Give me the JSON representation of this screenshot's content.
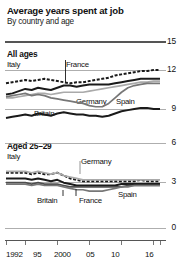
{
  "header": {
    "title": "Average years spent at job",
    "subtitle": "By country and age"
  },
  "panels": {
    "top": {
      "title": "All ages",
      "gridline_labels": [
        "15",
        "12",
        "9"
      ],
      "series_labels": [
        "Italy",
        "France",
        "Germany",
        "Spain",
        "Britain"
      ]
    },
    "bottom": {
      "title": "Aged 25–29",
      "gridline_labels": [
        "6",
        "3",
        "0"
      ],
      "series_labels": [
        "Italy",
        "Germany",
        "Britain",
        "France",
        "Spain"
      ]
    }
  },
  "xaxis": {
    "tick_labels": [
      "1992",
      "95",
      "2000",
      "05",
      "10",
      "16"
    ]
  },
  "colors": {
    "black": "#1a1a1a",
    "dark_gray": "#4d4d4d",
    "mid_gray": "#777777",
    "light_gray": "#aaaaaa",
    "gridline": "#9a9a9a",
    "rule": "#555555",
    "background": "#ffffff"
  },
  "chart_data": [
    {
      "type": "line",
      "title": "All ages",
      "subtitle": "Average years spent at job, by country and age",
      "xlabel": "",
      "ylabel": "Years",
      "xlim": [
        1992,
        2016
      ],
      "ylim": [
        6.7,
        15
      ],
      "gridlines": [
        15,
        12,
        9
      ],
      "grid": true,
      "legend": "inline-labels",
      "x": [
        1992,
        1993,
        1994,
        1995,
        1996,
        1997,
        1998,
        1999,
        2000,
        2001,
        2002,
        2003,
        2004,
        2005,
        2006,
        2007,
        2008,
        2009,
        2010,
        2011,
        2012,
        2013,
        2014,
        2015,
        2016
      ],
      "series": [
        {
          "name": "Italy",
          "style": "dashed",
          "color": "#1a1a1a",
          "values": [
            11.3,
            11.4,
            11.5,
            11.6,
            11.5,
            11.6,
            11.7,
            11.6,
            11.5,
            11.4,
            11.3,
            11.4,
            11.4,
            11.5,
            11.6,
            11.7,
            11.8,
            12.0,
            12.1,
            12.2,
            12.3,
            12.4,
            12.4,
            12.5,
            12.5
          ]
        },
        {
          "name": "France",
          "style": "solid",
          "color": "#1a1a1a",
          "values": [
            10.3,
            10.4,
            10.6,
            10.8,
            10.7,
            10.9,
            10.8,
            10.7,
            10.9,
            11.1,
            11.1,
            11.0,
            11.1,
            11.2,
            11.2,
            11.2,
            11.2,
            11.3,
            11.4,
            11.5,
            11.6,
            11.7,
            11.7,
            11.7,
            11.7
          ]
        },
        {
          "name": "Germany",
          "style": "solid",
          "color": "#aaaaaa",
          "values": [
            10.0,
            10.0,
            10.1,
            10.2,
            10.3,
            10.4,
            10.4,
            10.3,
            10.4,
            10.5,
            10.5,
            10.5,
            10.5,
            10.6,
            10.7,
            10.8,
            10.9,
            11.0,
            11.1,
            11.2,
            11.3,
            11.4,
            11.4,
            11.5,
            11.5
          ]
        },
        {
          "name": "Spain",
          "style": "solid",
          "color": "#777777",
          "values": [
            10.1,
            10.2,
            10.3,
            10.4,
            10.2,
            10.3,
            10.2,
            10.0,
            9.9,
            9.8,
            9.7,
            9.6,
            9.5,
            9.3,
            9.2,
            9.2,
            9.5,
            10.0,
            10.5,
            10.9,
            11.1,
            11.2,
            11.3,
            11.3,
            11.3
          ]
        },
        {
          "name": "Britain",
          "style": "solid",
          "color": "#1a1a1a",
          "values": [
            8.2,
            8.3,
            8.4,
            8.5,
            8.4,
            8.6,
            8.5,
            8.4,
            8.6,
            8.7,
            8.6,
            8.5,
            8.5,
            8.4,
            8.4,
            8.3,
            8.4,
            8.6,
            8.8,
            8.9,
            9.0,
            9.1,
            9.1,
            9.0,
            9.0
          ]
        }
      ]
    },
    {
      "type": "line",
      "title": "Aged 25–29",
      "xlabel": "",
      "ylabel": "Years",
      "xlim": [
        1992,
        2016
      ],
      "ylim": [
        1.9,
        6
      ],
      "gridlines": [
        6,
        3,
        0
      ],
      "grid": true,
      "legend": "inline-labels",
      "x": [
        1992,
        1993,
        1994,
        1995,
        1996,
        1997,
        1998,
        1999,
        2000,
        2001,
        2002,
        2003,
        2004,
        2005,
        2006,
        2007,
        2008,
        2009,
        2010,
        2011,
        2012,
        2013,
        2014,
        2015,
        2016
      ],
      "series": [
        {
          "name": "Italy",
          "style": "dashed",
          "color": "#1a1a1a",
          "values": [
            3.9,
            3.9,
            3.9,
            3.9,
            3.8,
            3.9,
            3.8,
            3.8,
            3.9,
            3.7,
            3.5,
            3.4,
            3.3,
            3.3,
            3.3,
            3.3,
            3.3,
            3.3,
            3.3,
            3.3,
            3.3,
            3.4,
            3.3,
            3.3,
            3.3
          ]
        },
        {
          "name": "Germany",
          "style": "solid",
          "color": "#aaaaaa",
          "values": [
            4.0,
            4.0,
            4.0,
            4.0,
            3.9,
            4.0,
            3.9,
            3.8,
            3.9,
            3.7,
            3.6,
            3.5,
            3.4,
            3.4,
            3.4,
            3.4,
            3.4,
            3.4,
            3.4,
            3.4,
            3.4,
            3.4,
            3.4,
            3.4,
            3.4
          ]
        },
        {
          "name": "Britain",
          "style": "solid",
          "color": "#1a1a1a",
          "values": [
            3.5,
            3.5,
            3.5,
            3.5,
            3.4,
            3.5,
            3.4,
            3.3,
            3.4,
            3.2,
            3.1,
            3.0,
            3.0,
            3.0,
            3.0,
            3.0,
            3.0,
            3.0,
            3.1,
            3.1,
            3.1,
            3.1,
            3.1,
            3.1,
            3.1
          ]
        },
        {
          "name": "France",
          "style": "solid",
          "color": "#4d4d4d",
          "values": [
            3.2,
            3.2,
            3.2,
            3.2,
            3.1,
            3.2,
            3.1,
            3.1,
            3.1,
            3.0,
            2.9,
            2.9,
            2.9,
            2.9,
            2.9,
            2.9,
            2.9,
            2.9,
            2.9,
            3.0,
            3.0,
            3.0,
            3.0,
            3.0,
            3.0
          ]
        },
        {
          "name": "Spain",
          "style": "solid",
          "color": "#777777",
          "values": [
            3.1,
            3.1,
            3.1,
            3.1,
            3.0,
            3.1,
            3.0,
            3.0,
            3.0,
            2.9,
            2.8,
            2.7,
            2.7,
            2.6,
            2.6,
            2.6,
            2.7,
            2.8,
            2.9,
            2.9,
            3.0,
            3.0,
            3.0,
            3.0,
            3.0
          ]
        }
      ]
    }
  ]
}
